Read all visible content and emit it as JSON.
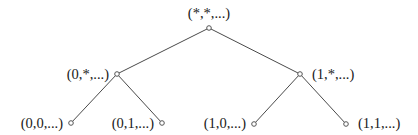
{
  "diagram": {
    "type": "binary-tree",
    "colors": {
      "edge": "#4a4a4a",
      "node_stroke": "#555555",
      "text": "#1a1a1a",
      "background": "#ffffff"
    },
    "nodes": [
      {
        "id": "root",
        "label": "(*,*,...)",
        "x": 209,
        "y": 28,
        "label_x": 209,
        "label_y": 18,
        "anchor": "middle"
      },
      {
        "id": "n0",
        "label": "(0,*,...)",
        "x": 117,
        "y": 74,
        "label_x": 109,
        "label_y": 79,
        "anchor": "end"
      },
      {
        "id": "n1",
        "label": "(1,*,...)",
        "x": 300,
        "y": 74,
        "label_x": 312,
        "label_y": 79,
        "anchor": "start"
      },
      {
        "id": "n00",
        "label": "(0,0,...)",
        "x": 71,
        "y": 123,
        "label_x": 63,
        "label_y": 128,
        "anchor": "end"
      },
      {
        "id": "n01",
        "label": "(0,1,...)",
        "x": 162,
        "y": 123,
        "label_x": 154,
        "label_y": 128,
        "anchor": "end"
      },
      {
        "id": "n10",
        "label": "(1,0,...)",
        "x": 254,
        "y": 124,
        "label_x": 246,
        "label_y": 128,
        "anchor": "end"
      },
      {
        "id": "n11",
        "label": "(1,1,...)",
        "x": 346,
        "y": 124,
        "label_x": 358,
        "label_y": 128,
        "anchor": "start"
      }
    ],
    "edges": [
      {
        "from": "root",
        "to": "n0"
      },
      {
        "from": "root",
        "to": "n1"
      },
      {
        "from": "n0",
        "to": "n00"
      },
      {
        "from": "n0",
        "to": "n01"
      },
      {
        "from": "n1",
        "to": "n10"
      },
      {
        "from": "n1",
        "to": "n11"
      }
    ]
  }
}
